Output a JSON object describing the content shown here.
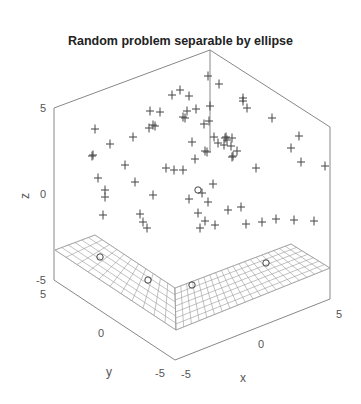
{
  "chart_data": {
    "type": "scatter3d",
    "title": "Random problem separable by ellipse",
    "xlabel": "x",
    "ylabel": "y",
    "zlabel": "z",
    "xlim": [
      -5,
      5
    ],
    "ylim": [
      -5,
      5
    ],
    "zlim": [
      -5,
      5
    ],
    "x_ticks": [
      "-5",
      "0",
      "5"
    ],
    "y_ticks": [
      "5",
      "0",
      "-5"
    ],
    "z_ticks": [
      "5",
      "0",
      "-5"
    ],
    "grid": false,
    "surface": {
      "type": "plane",
      "z": -3.3,
      "description": "mesh plane at low z"
    },
    "series": [
      {
        "name": "class +",
        "marker": "+",
        "screen_points": [
          [
            208,
            76
          ],
          [
            219,
            84
          ],
          [
            180,
            90
          ],
          [
            172,
            95
          ],
          [
            189,
            96
          ],
          [
            210,
            106
          ],
          [
            243,
            98
          ],
          [
            243,
            101
          ],
          [
            247,
            108
          ],
          [
            150,
            111
          ],
          [
            160,
            112
          ],
          [
            187,
            111
          ],
          [
            183,
            117
          ],
          [
            196,
            109
          ],
          [
            272,
            118
          ],
          [
            95,
            129
          ],
          [
            155,
            126
          ],
          [
            149,
            128
          ],
          [
            185,
            118
          ],
          [
            133,
            137
          ],
          [
            110,
            144
          ],
          [
            92,
            156
          ],
          [
            93,
            155
          ],
          [
            125,
            165
          ],
          [
            153,
            125
          ],
          [
            204,
            124
          ],
          [
            209,
            121
          ],
          [
            214,
            137
          ],
          [
            226,
            137
          ],
          [
            232,
            138
          ],
          [
            231,
            146
          ],
          [
            225,
            138
          ],
          [
            192,
            142
          ],
          [
            218,
            143
          ],
          [
            224,
            145
          ],
          [
            227,
            140
          ],
          [
            299,
            136
          ],
          [
            291,
            148
          ],
          [
            98,
            178
          ],
          [
            195,
            159
          ],
          [
            205,
            151
          ],
          [
            207,
            152
          ],
          [
            233,
            156
          ],
          [
            237,
            151
          ],
          [
            232,
            157
          ],
          [
            256,
            168
          ],
          [
            301,
            162
          ],
          [
            325,
            166
          ],
          [
            183,
            170
          ],
          [
            135,
            182
          ],
          [
            166,
            168
          ],
          [
            105,
            190
          ],
          [
            105,
            197
          ],
          [
            103,
            215
          ],
          [
            174,
            170
          ],
          [
            213,
            184
          ],
          [
            202,
            193
          ],
          [
            153,
            195
          ],
          [
            189,
            199
          ],
          [
            208,
            202
          ],
          [
            140,
            214
          ],
          [
            143,
            222
          ],
          [
            228,
            210
          ],
          [
            241,
            207
          ],
          [
            276,
            219
          ],
          [
            294,
            220
          ],
          [
            314,
            221
          ],
          [
            198,
            213
          ],
          [
            205,
            221
          ],
          [
            215,
            225
          ],
          [
            246,
            224
          ],
          [
            262,
            222
          ],
          [
            200,
            228
          ],
          [
            147,
            228
          ]
        ]
      },
      {
        "name": "class o",
        "marker": "o",
        "screen_points": [
          [
            198,
            190
          ],
          [
            100,
            257
          ],
          [
            148,
            280
          ],
          [
            192,
            285
          ],
          [
            266,
            263
          ]
        ]
      }
    ]
  }
}
